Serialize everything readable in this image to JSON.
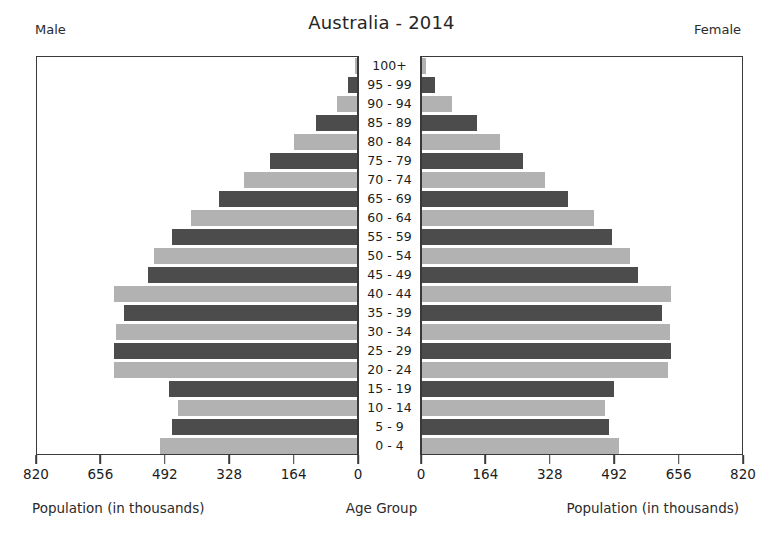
{
  "header": {
    "title": "Australia - 2014",
    "male_label": "Male",
    "female_label": "Female"
  },
  "captions": {
    "left": "Population (in thousands)",
    "center": "Age Group",
    "right": "Population (in thousands)"
  },
  "chart_data": {
    "type": "bar",
    "subtype": "population-pyramid",
    "title": "Australia - 2014",
    "xlabel": "Population (in thousands)",
    "ylabel": "Age Group",
    "grid": false,
    "legend": [
      "Male",
      "Female"
    ],
    "legend_position": "top-corners",
    "units": "thousands",
    "xlim_left": [
      820,
      0
    ],
    "xlim_right": [
      0,
      820
    ],
    "xticks_left": [
      "820",
      "656",
      "492",
      "328",
      "164",
      "0"
    ],
    "xticks_right": [
      "0",
      "164",
      "328",
      "492",
      "656",
      "820"
    ],
    "xtick_values": [
      0,
      164,
      328,
      492,
      656,
      820
    ],
    "axis_max": 820,
    "categories": [
      "100+",
      "95 - 99",
      "90 - 94",
      "85 - 89",
      "80 - 84",
      "75 - 79",
      "70 - 74",
      "65 - 69",
      "60 - 64",
      "55 - 59",
      "50 - 54",
      "45 - 49",
      "40 - 44",
      "35 - 39",
      "30 - 34",
      "25 - 29",
      "20 - 24",
      "15 - 19",
      "10 - 14",
      "5 - 9",
      "0 - 4"
    ],
    "series": [
      {
        "name": "Male",
        "side": "left",
        "values": [
          4,
          22,
          52,
          104,
          160,
          222,
          289,
          352,
          422,
          470,
          516,
          533,
          620,
          593,
          613,
          620,
          618,
          478,
          457,
          470,
          501
        ]
      },
      {
        "name": "Female",
        "side": "right",
        "values": [
          9,
          33,
          76,
          140,
          199,
          257,
          313,
          372,
          437,
          483,
          530,
          549,
          634,
          611,
          631,
          634,
          627,
          490,
          466,
          477,
          502
        ]
      }
    ],
    "colors": {
      "bar_dark": "#4c4c4c",
      "bar_light": "#b2b2b2",
      "axis": "#3a3a3a",
      "background": "#ffffff",
      "text": "#1c1c1c"
    }
  }
}
